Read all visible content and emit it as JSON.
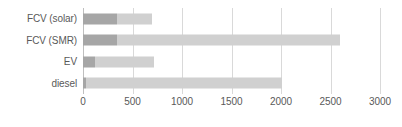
{
  "chart_data": {
    "type": "bar",
    "orientation": "horizontal",
    "stacked": true,
    "title": "",
    "xlabel": "",
    "ylabel": "",
    "xlim": [
      0,
      3000
    ],
    "xticks": [
      0,
      500,
      1000,
      1500,
      2000,
      2500,
      3000
    ],
    "xtick_labels": [
      "0",
      "500",
      "1000",
      "1500",
      "2000",
      "2500",
      "3000"
    ],
    "grid": true,
    "legend": false,
    "categories": [
      "FCV (solar)",
      "FCV (SMR)",
      "EV",
      "diesel"
    ],
    "series": [
      {
        "name": "segment-1",
        "color": "#a6a6a6",
        "values": [
          340,
          345,
          125,
          30
        ]
      },
      {
        "name": "segment-2",
        "color": "#d0d0d0",
        "values": [
          355,
          2250,
          590,
          1985
        ]
      }
    ],
    "totals": [
      695,
      2595,
      715,
      2015
    ]
  },
  "axis": {
    "gridline_color": "#d9d9d9",
    "origin_line_color": "#bfbfbf",
    "tick_text_color": "#595959"
  }
}
